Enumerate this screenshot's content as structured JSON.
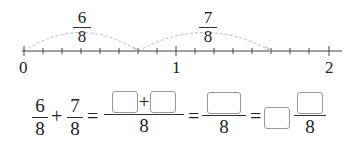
{
  "number_line": {
    "start": 0,
    "end": 2,
    "denominator": 8,
    "labels": [
      "0",
      "1",
      "2"
    ],
    "jumps": [
      {
        "numerator": "6",
        "denominator": "8",
        "from": 0,
        "to": 0.75
      },
      {
        "numerator": "7",
        "denominator": "8",
        "from": 0.75,
        "to": 1.625
      }
    ]
  },
  "equation": {
    "term1": {
      "numerator": "6",
      "denominator": "8"
    },
    "plus": "+",
    "term2": {
      "numerator": "7",
      "denominator": "8"
    },
    "equals": "=",
    "step1": {
      "numerator_blanks": 2,
      "operator": "+",
      "denominator": "8"
    },
    "step2": {
      "numerator_blanks": 1,
      "denominator": "8"
    },
    "step3": {
      "whole_blank": 1,
      "numerator_blanks": 1,
      "denominator": "8"
    }
  }
}
